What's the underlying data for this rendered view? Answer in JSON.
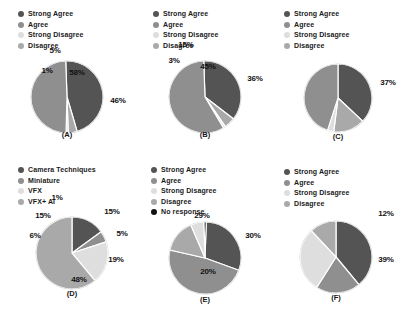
{
  "figure": {
    "title": "",
    "panel_count": 6,
    "layout": "3 columns x 2 rows"
  },
  "palette": {
    "strong_agree": "#545454",
    "agree": "#8f8f8f",
    "strong_disagree": "#dedede",
    "disagree": "#a9a9a9",
    "no_response": "#121212",
    "camera_techniques": "#545454",
    "miniature": "#8f8f8f",
    "vfx": "#dedede",
    "vfx_ai": "#a9a9a9",
    "background": "#ffffff",
    "label_text": "#111111",
    "divider": "#ffffff"
  },
  "chart_data": [
    {
      "type": "pie",
      "id": "A",
      "caption": "(A)",
      "title": "",
      "legend_position": "top-left",
      "legend": [
        "Strong Agree",
        "Agree",
        "Strong Disagree",
        "Disagree"
      ],
      "categories": [
        "Strong Agree",
        "Agree",
        "Strong Disagree",
        "Disagree"
      ],
      "values": [
        46,
        49,
        1,
        4
      ],
      "labels": [
        "46%",
        "49%",
        "1%",
        "4%"
      ],
      "colors": [
        "#545454",
        "#8f8f8f",
        "#dedede",
        "#a9a9a9"
      ],
      "units": "percent"
    },
    {
      "type": "pie",
      "id": "B",
      "caption": "(B)",
      "title": "",
      "legend_position": "top-left",
      "legend": [
        "Strong Agree",
        "Agree",
        "Strong Disagree",
        "Disagree"
      ],
      "categories": [
        "Strong Agree",
        "Agree",
        "Strong Disagree",
        "Disagree"
      ],
      "values": [
        36,
        58,
        1,
        5
      ],
      "labels": [
        "36%",
        "58%",
        "1%",
        "5%"
      ],
      "colors": [
        "#545454",
        "#8f8f8f",
        "#dedede",
        "#a9a9a9"
      ],
      "units": "percent"
    },
    {
      "type": "pie",
      "id": "C",
      "caption": "(C)",
      "title": "",
      "legend_position": "top-left",
      "legend": [
        "Strong Agree",
        "Agree",
        "Strong Disagree",
        "Disagree"
      ],
      "categories": [
        "Strong Agree",
        "Agree",
        "Strong Disagree",
        "Disagree"
      ],
      "values": [
        37,
        45,
        3,
        15
      ],
      "labels": [
        "37%",
        "45%",
        "3%",
        "15%"
      ],
      "colors": [
        "#545454",
        "#8f8f8f",
        "#dedede",
        "#a9a9a9"
      ],
      "units": "percent"
    },
    {
      "type": "pie",
      "id": "D",
      "caption": "(D)",
      "title": "",
      "legend_position": "top-left",
      "legend": [
        "Camera Techniques",
        "Miniature",
        "VFX",
        "VFX+ AI"
      ],
      "categories": [
        "Camera Techniques",
        "Miniature",
        "VFX",
        "VFX+ AI"
      ],
      "values": [
        15,
        5,
        19,
        61
      ],
      "labels": [
        "15%",
        "5%",
        "19%",
        "61%"
      ],
      "colors": [
        "#545454",
        "#8f8f8f",
        "#dedede",
        "#a9a9a9"
      ],
      "units": "percent"
    },
    {
      "type": "pie",
      "id": "E",
      "caption": "(E)",
      "title": "",
      "legend_position": "top-left",
      "legend": [
        "Strong Agree",
        "Agree",
        "Strong Disagree",
        "Disagree",
        "No response"
      ],
      "categories": [
        "Strong Agree",
        "Agree",
        "Strong Disagree",
        "Disagree",
        "No response"
      ],
      "values": [
        30,
        48,
        6,
        15,
        1
      ],
      "labels": [
        "30%",
        "48%",
        "6%",
        "15%",
        "1%"
      ],
      "colors": [
        "#545454",
        "#8f8f8f",
        "#dedede",
        "#a9a9a9",
        "#121212"
      ],
      "units": "percent"
    },
    {
      "type": "pie",
      "id": "F",
      "caption": "(F)",
      "title": "",
      "legend_position": "top-left",
      "legend": [
        "Strong Agree",
        "Agree",
        "Strong Disagree",
        "Disagree"
      ],
      "categories": [
        "Strong Agree",
        "Agree",
        "Strong Disagree",
        "Disagree"
      ],
      "values": [
        39,
        20,
        29,
        12
      ],
      "labels": [
        "39%",
        "20%",
        "29%",
        "12%"
      ],
      "colors": [
        "#545454",
        "#8f8f8f",
        "#dedede",
        "#a9a9a9"
      ],
      "units": "percent"
    }
  ],
  "panels": {
    "a": {
      "caption": "(A)",
      "legend": [
        {
          "label": "Strong Agree",
          "color": "#545454"
        },
        {
          "label": "Agree",
          "color": "#8f8f8f"
        },
        {
          "label": "Strong Disagree",
          "color": "#dedede"
        },
        {
          "label": "Disagree",
          "color": "#a9a9a9"
        }
      ],
      "slices": [
        {
          "label": "46%",
          "value": 46,
          "color": "#545454"
        },
        {
          "label": "49%",
          "value": 49,
          "color": "#8f8f8f"
        },
        {
          "label": "1%",
          "value": 1,
          "color": "#dedede"
        },
        {
          "label": "4%",
          "value": 4,
          "color": "#a9a9a9"
        }
      ]
    },
    "b": {
      "caption": "(B)",
      "legend": [
        {
          "label": "Strong Agree",
          "color": "#545454"
        },
        {
          "label": "Agree",
          "color": "#8f8f8f"
        },
        {
          "label": "Strong Disagree",
          "color": "#dedede"
        },
        {
          "label": "Disagree",
          "color": "#a9a9a9"
        }
      ],
      "slices": [
        {
          "label": "36%",
          "value": 36,
          "color": "#545454"
        },
        {
          "label": "58%",
          "value": 58,
          "color": "#8f8f8f"
        },
        {
          "label": "1%",
          "value": 1,
          "color": "#dedede"
        },
        {
          "label": "5%",
          "value": 5,
          "color": "#a9a9a9"
        }
      ]
    },
    "c": {
      "caption": "(C)",
      "legend": [
        {
          "label": "Strong Agree",
          "color": "#545454"
        },
        {
          "label": "Agree",
          "color": "#8f8f8f"
        },
        {
          "label": "Strong Disagree",
          "color": "#dedede"
        },
        {
          "label": "Disagree",
          "color": "#a9a9a9"
        }
      ],
      "slices": [
        {
          "label": "37%",
          "value": 37,
          "color": "#545454"
        },
        {
          "label": "45%",
          "value": 45,
          "color": "#8f8f8f"
        },
        {
          "label": "3%",
          "value": 3,
          "color": "#dedede"
        },
        {
          "label": "15%",
          "value": 15,
          "color": "#a9a9a9"
        }
      ]
    },
    "d": {
      "caption": "(D)",
      "legend": [
        {
          "label": "Camera Techniques",
          "color": "#545454"
        },
        {
          "label": "Miniature",
          "color": "#8f8f8f"
        },
        {
          "label": "VFX",
          "color": "#dedede"
        },
        {
          "label": "VFX+ AI",
          "color": "#a9a9a9"
        }
      ],
      "slices": [
        {
          "label": "15%",
          "value": 15,
          "color": "#545454"
        },
        {
          "label": "5%",
          "value": 5,
          "color": "#8f8f8f"
        },
        {
          "label": "19%",
          "value": 19,
          "color": "#dedede"
        },
        {
          "label": "61%",
          "value": 61,
          "color": "#a9a9a9"
        }
      ]
    },
    "e": {
      "caption": "(E)",
      "legend": [
        {
          "label": "Strong Agree",
          "color": "#545454"
        },
        {
          "label": "Agree",
          "color": "#8f8f8f"
        },
        {
          "label": "Strong Disagree",
          "color": "#dedede"
        },
        {
          "label": "Disagree",
          "color": "#a9a9a9"
        },
        {
          "label": "No response",
          "color": "#121212"
        }
      ],
      "slices": [
        {
          "label": "30%",
          "value": 30,
          "color": "#545454"
        },
        {
          "label": "48%",
          "value": 48,
          "color": "#8f8f8f"
        },
        {
          "label": "6%",
          "value": 6,
          "color": "#dedede"
        },
        {
          "label": "15%",
          "value": 15,
          "color": "#a9a9a9"
        },
        {
          "label": "1%",
          "value": 1,
          "color": "#121212"
        }
      ]
    },
    "f": {
      "caption": "(F)",
      "legend": [
        {
          "label": "Strong Agree",
          "color": "#545454"
        },
        {
          "label": "Agree",
          "color": "#8f8f8f"
        },
        {
          "label": "Strong Disagree",
          "color": "#dedede"
        },
        {
          "label": "Disagree",
          "color": "#a9a9a9"
        }
      ],
      "slices": [
        {
          "label": "39%",
          "value": 39,
          "color": "#545454"
        },
        {
          "label": "20%",
          "value": 20,
          "color": "#8f8f8f"
        },
        {
          "label": "29%",
          "value": 29,
          "color": "#dedede"
        },
        {
          "label": "12%",
          "value": 12,
          "color": "#a9a9a9"
        }
      ]
    }
  }
}
